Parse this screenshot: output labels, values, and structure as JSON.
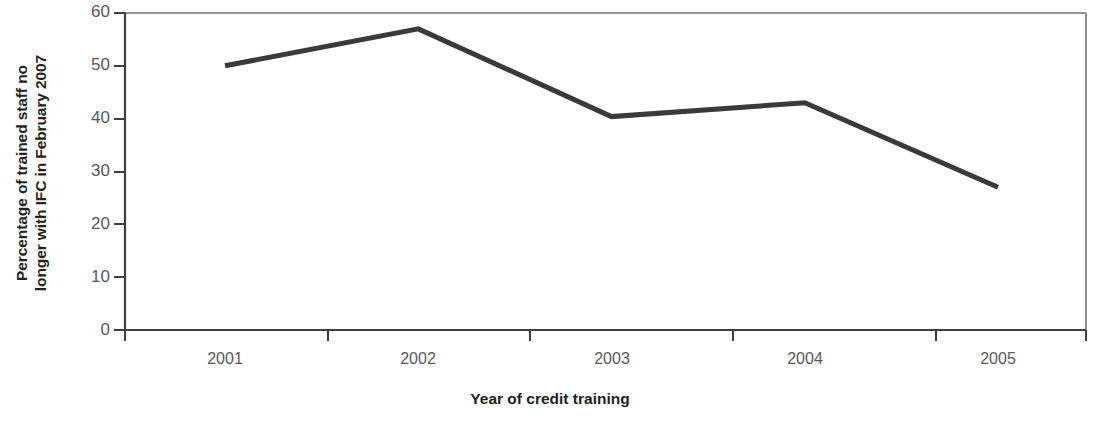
{
  "chart_data": {
    "type": "line",
    "title": "",
    "subtitle": "",
    "xlabel": "Year of credit training",
    "ylabel": "Percentage of trained staff no longer with IFC in February 2007",
    "ylabel_lines": [
      "Percentage of trained staff no",
      "longer with IFC in February 2007"
    ],
    "categories": [
      "2001",
      "2002",
      "2003",
      "2004",
      "2005"
    ],
    "values": [
      50,
      57,
      40.4,
      43,
      27
    ],
    "x": [
      2001,
      2002,
      2003,
      2004,
      2005
    ],
    "ylim": [
      0,
      60
    ],
    "yticks": [
      0,
      10,
      20,
      30,
      40,
      50,
      60
    ],
    "ytick_labels": [
      "0",
      "10",
      "20",
      "30",
      "40",
      "50",
      "60"
    ],
    "xtick_labels": [
      "2001",
      "2002",
      "2003",
      "2004",
      "2005"
    ],
    "grid": false,
    "legend": null,
    "legend_position": "none",
    "series": [
      {
        "name": "Percentage of trained staff no longer with IFC in February 2007",
        "values": [
          50,
          57,
          40.4,
          43,
          27
        ],
        "color": "#3a3a3a",
        "line_width": 5
      }
    ],
    "annotations": [],
    "colors": {
      "line": "#3a3a3a",
      "axis": "#3f3f3f",
      "frame": "#6f6f6f",
      "tick_label": "#58595b",
      "axis_title": "#231f20",
      "background": "#ffffff"
    }
  }
}
